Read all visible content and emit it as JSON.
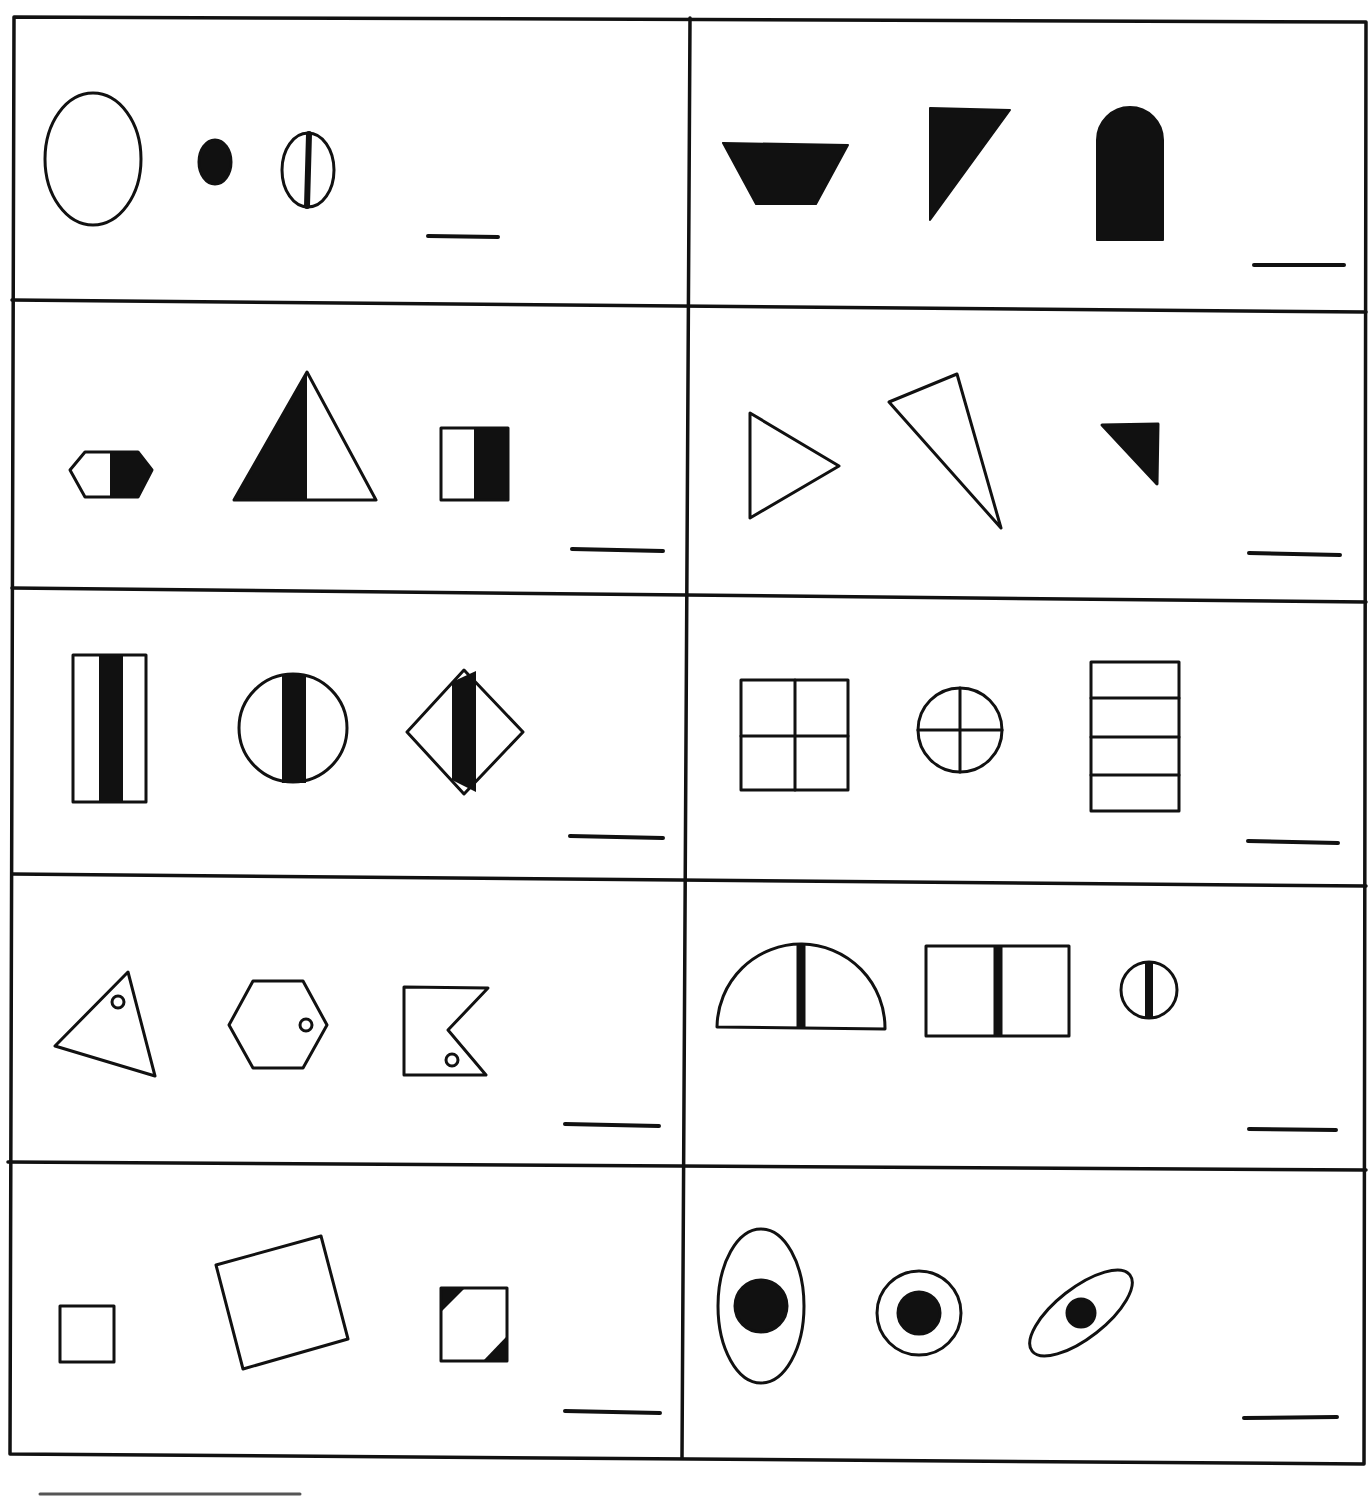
{
  "worksheet": {
    "ink_color": "#111111",
    "paper_color": "#ffffff",
    "grid": {
      "columns": 2,
      "rows": 5
    },
    "cells": [
      {
        "id": "r1-left",
        "shapes": [
          "large-outline-circle",
          "small-filled-circle",
          "circle-with-vertical-bar"
        ],
        "answer_blank": ""
      },
      {
        "id": "r1-right",
        "shapes": [
          "filled-inverted-trapezoid",
          "filled-right-triangle",
          "filled-arch"
        ],
        "answer_blank": ""
      },
      {
        "id": "r2-left",
        "shapes": [
          "half-filled-hexagon",
          "half-filled-triangle",
          "half-filled-square"
        ],
        "answer_blank": ""
      },
      {
        "id": "r2-right",
        "shapes": [
          "outline-triangle-pointing-right",
          "outline-thin-triangle",
          "small-filled-triangle"
        ],
        "answer_blank": ""
      },
      {
        "id": "r3-left",
        "shapes": [
          "rectangle-with-center-bar",
          "circle-with-center-bar",
          "diamond-with-center-bar"
        ],
        "answer_blank": ""
      },
      {
        "id": "r3-right",
        "shapes": [
          "square-divided-in-four",
          "circle-with-cross",
          "rectangle-with-horizontal-lines"
        ],
        "answer_blank": ""
      },
      {
        "id": "r4-left",
        "shapes": [
          "triangle-with-small-circle",
          "hexagon-with-small-circle",
          "notched-flag-with-small-circle"
        ],
        "answer_blank": ""
      },
      {
        "id": "r4-right",
        "shapes": [
          "semicircle-with-center-bar",
          "rectangle-with-center-bar",
          "small-circle-with-center-bar"
        ],
        "answer_blank": ""
      },
      {
        "id": "r5-left",
        "shapes": [
          "small-outline-square",
          "large-tilted-square",
          "square-with-filled-corners"
        ],
        "answer_blank": ""
      },
      {
        "id": "r5-right",
        "shapes": [
          "tall-ellipse-with-dot",
          "circle-with-dot",
          "tilted-ellipse-with-dot"
        ],
        "answer_blank": ""
      }
    ]
  }
}
